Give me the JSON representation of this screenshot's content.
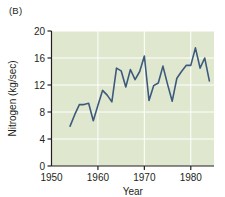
{
  "panel": {
    "label": "(B)"
  },
  "colors": {
    "plot_background": "#dfe8cf",
    "gridline": "#ffffff",
    "line": "#3d5a7d",
    "axis": "#231f20",
    "text": "#231f20",
    "page_background": "#ffffff"
  },
  "chart_data": {
    "type": "line",
    "title": "",
    "xlabel": "Year",
    "ylabel": "Nitrogen (kg/sec)",
    "xlim": [
      1950,
      1985
    ],
    "ylim": [
      0,
      20
    ],
    "xticks": [
      1950,
      1960,
      1970,
      1980
    ],
    "xtick_labels": [
      "1950",
      "1960",
      "1970",
      "1980"
    ],
    "yticks": [
      0,
      4,
      8,
      12,
      16,
      20
    ],
    "ytick_labels": [
      "0",
      "4",
      "8",
      "12",
      "16",
      "20"
    ],
    "grid": true,
    "grid_axis": "both",
    "legend": "none",
    "series": [
      {
        "name": "Nitrogen flux",
        "x": [
          1954,
          1955,
          1956,
          1957,
          1958,
          1959,
          1960,
          1961,
          1962,
          1963,
          1964,
          1965,
          1966,
          1967,
          1968,
          1969,
          1970,
          1971,
          1972,
          1973,
          1974,
          1975,
          1976,
          1977,
          1978,
          1979,
          1980,
          1981,
          1982,
          1983,
          1984
        ],
        "values": [
          5.9,
          7.6,
          9.1,
          9.1,
          9.3,
          6.7,
          9.0,
          11.2,
          10.5,
          9.5,
          14.5,
          14.1,
          11.7,
          14.3,
          12.8,
          14.0,
          16.3,
          9.7,
          11.9,
          12.3,
          14.8,
          12.1,
          9.6,
          13.0,
          14.0,
          14.9,
          14.9,
          17.5,
          14.5,
          16.0,
          12.6
        ]
      }
    ]
  }
}
